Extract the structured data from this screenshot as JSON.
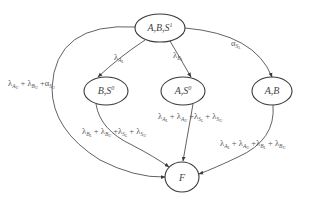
{
  "diagram": {
    "type": "state-transition",
    "nodes": [
      {
        "id": "ABS1",
        "label": "A,B,S",
        "sup": "1",
        "cx": 160,
        "cy": 28,
        "rx": 25,
        "ry": 14
      },
      {
        "id": "BS0",
        "label": "B,S",
        "sup": "0",
        "cx": 106,
        "cy": 91,
        "rx": 22,
        "ry": 14
      },
      {
        "id": "AS0",
        "label": "A,S",
        "sup": "0",
        "cx": 183,
        "cy": 91,
        "rx": 22,
        "ry": 14
      },
      {
        "id": "AB",
        "label": "A,B",
        "sup": "",
        "cx": 272,
        "cy": 91,
        "rx": 20,
        "ry": 14
      },
      {
        "id": "F",
        "label": "F",
        "sup": "",
        "cx": 182,
        "cy": 177,
        "rx": 17,
        "ry": 15
      }
    ],
    "edges": [
      {
        "from": "ABS1",
        "to": "BS0",
        "label": "λ_{A_L}"
      },
      {
        "from": "ABS1",
        "to": "AS0",
        "label": "λ_{B_L}"
      },
      {
        "from": "ABS1",
        "to": "AB",
        "label": "α_{S_L}"
      },
      {
        "from": "ABS1",
        "to": "F",
        "label": "λ_{A_U} + λ_{B_U} + α_{S_U}"
      },
      {
        "from": "BS0",
        "to": "F",
        "label": "λ_{B_L} + λ_{B_U} + λ_{S_L} + λ_{S_U}"
      },
      {
        "from": "AS0",
        "to": "F",
        "label": "λ_{A_L} + λ_{A_U} + λ_{S_L} + λ_{S_U}"
      },
      {
        "from": "AB",
        "to": "F",
        "label": "λ_{A_L} + λ_{A_U} + λ_{B_L} + λ_{B_U}"
      }
    ]
  },
  "labels": {
    "n_abs1": {
      "main": "A,B,S",
      "sup": "1"
    },
    "n_bs0": {
      "main": "B,S",
      "sup": "0"
    },
    "n_as0": {
      "main": "A,S",
      "sup": "0"
    },
    "n_ab": {
      "main": "A,B"
    },
    "n_f": {
      "main": "F"
    },
    "e1": {
      "sym": "λ",
      "sub1": "A",
      "sub2": "L"
    },
    "e2": {
      "sym": "λ",
      "sub1": "B",
      "sub2": "L"
    },
    "e3": {
      "sym": "α",
      "sub1": "S",
      "sub2": "L"
    },
    "e4": {
      "t1": "λ",
      "s1": "A",
      "ss1": "U",
      "plus1": " + ",
      "t2": "λ",
      "s2": "B",
      "ss2": "U",
      "plus2": " +",
      "t3": "α",
      "s3": "S",
      "ss3": "U"
    },
    "e5": {
      "t1": "λ",
      "s1": "B",
      "ss1": "L",
      "plus1": " + ",
      "t2": "λ",
      "s2": "B",
      "ss2": "U",
      "plus2": " +",
      "t3": "λ",
      "s3": "S",
      "ss3": "L",
      "plus3": " + ",
      "t4": "λ",
      "s4": "S",
      "ss4": "U"
    },
    "e6": {
      "t1": "λ",
      "s1": "A",
      "ss1": "L",
      "plus1": " + ",
      "t2": "λ",
      "s2": "A",
      "ss2": "U",
      "plus2": " +",
      "t3": "λ",
      "s3": "S",
      "ss3": "L",
      "plus3": " + ",
      "t4": "λ",
      "s4": "S",
      "ss4": "U"
    },
    "e7": {
      "t1": "λ",
      "s1": "A",
      "ss1": "L",
      "plus1": " + ",
      "t2": "λ",
      "s2": "A",
      "ss2": "U",
      "plus2": " +",
      "t3": "λ",
      "s3": "B",
      "ss3": "L",
      "plus3": " + ",
      "t4": "λ",
      "s4": "B",
      "ss4": "U"
    }
  },
  "colors": {
    "stroke": "#3a3a3a",
    "text": "#555555",
    "background": "#ffffff"
  }
}
